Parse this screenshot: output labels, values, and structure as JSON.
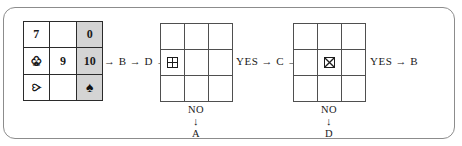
{
  "figure": {
    "type": "decision-flow-diagram",
    "frame_border_color": "#8c8c8c",
    "shaded_cell_color": "#d4d4d4"
  },
  "source_grid": {
    "name": "source-card-grid",
    "rows": [
      [
        {
          "text": "7",
          "shaded": false,
          "rotated": false,
          "kind": "number"
        },
        {
          "text": "",
          "shaded": false,
          "rotated": false,
          "kind": "empty"
        },
        {
          "text": "0",
          "shaded": true,
          "rotated": false,
          "kind": "number"
        }
      ],
      [
        {
          "text": "♣",
          "shaded": false,
          "rotated": false,
          "kind": "club-outline"
        },
        {
          "text": "6",
          "shaded": false,
          "rotated": true,
          "kind": "number"
        },
        {
          "text": "10",
          "shaded": true,
          "rotated": false,
          "kind": "number"
        }
      ],
      [
        {
          "text": "♥",
          "shaded": false,
          "rotated": true,
          "kind": "heart-outline"
        },
        {
          "text": "",
          "shaded": false,
          "rotated": false,
          "kind": "empty"
        },
        {
          "text": "♠",
          "shaded": true,
          "rotated": false,
          "kind": "spade-filled"
        }
      ]
    ]
  },
  "board_1": {
    "name": "board-grid-1",
    "marker": {
      "icon": "quartered-square-icon",
      "row": 1,
      "col": 0
    },
    "cells": [
      [
        "",
        "",
        ""
      ],
      [
        "marker",
        "",
        ""
      ],
      [
        "",
        "",
        ""
      ]
    ]
  },
  "board_2": {
    "name": "board-grid-2",
    "marker": {
      "icon": "crossed-square-icon",
      "row": 1,
      "col": 1
    },
    "cells": [
      [
        "",
        "",
        ""
      ],
      [
        "",
        "marker",
        ""
      ],
      [
        "",
        "",
        ""
      ]
    ]
  },
  "connectors": {
    "c1": "→ B → D →",
    "c2": "YES → C →",
    "c3": "YES → B"
  },
  "branches": [
    {
      "condition": "NO",
      "arrow": "↓",
      "target": "A"
    },
    {
      "condition": "NO",
      "arrow": "↓",
      "target": "D"
    }
  ]
}
